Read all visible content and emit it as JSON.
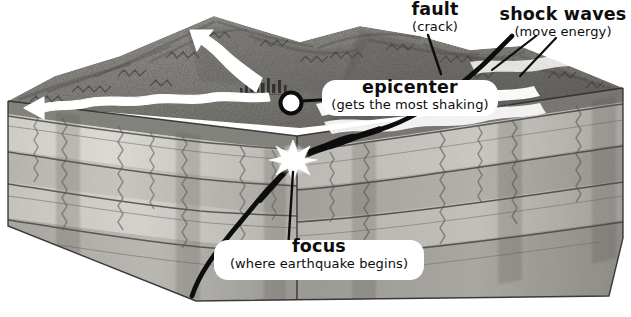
{
  "figure": {
    "background_color": "#ffffff",
    "ink_color": "#0d0d0d",
    "width": 631,
    "height": 317
  },
  "labels": {
    "fault": {
      "term": "fault",
      "note": "(crack)"
    },
    "shock_waves": {
      "term": "shock waves",
      "note": "(move energy)"
    },
    "epicenter": {
      "term": "epicenter",
      "note": "(gets the most shaking)"
    },
    "focus": {
      "term": "focus",
      "note": "(where earthquake begins)"
    }
  },
  "markers": {
    "epicenter_marker": {
      "name": "epicenter-circle",
      "x": 291,
      "y": 103,
      "radius": 9
    },
    "focus_marker": {
      "name": "focus-star",
      "x": 293,
      "y": 160,
      "points": 10
    }
  },
  "block": {
    "description": "Cut-away rectangular block of crust with layered rock strata and a mountainous top surface.",
    "top_surface": "mountain terrain with shaded ridges",
    "strata_layers": [
      {
        "name": "surface soil",
        "shade": "#8e8e8e"
      },
      {
        "name": "upper rock layer",
        "shade": "#d9d7d2"
      },
      {
        "name": "middle rock layer",
        "shade": "#b4b2ad"
      },
      {
        "name": "lower rock layer",
        "shade": "#c9c7c2"
      },
      {
        "name": "deep rock layer",
        "shade": "#a3a19c"
      }
    ]
  },
  "features": {
    "shock_wave_arrows": {
      "name": "white wavy arrows radiating from epicenter across the surface",
      "color": "#ffffff",
      "count": 3
    },
    "fault_line": {
      "name": "thick black crack running from focus up through the surface and down the front face",
      "color": "#0d0d0d"
    },
    "city": {
      "name": "small cluster of buildings near the epicenter"
    },
    "leader_lines": [
      {
        "from": "epicenter-circle",
        "to": "epicenter-label"
      },
      {
        "from": "focus-star",
        "to": "focus-label"
      },
      {
        "from": "fault-label",
        "to": "fault-line"
      },
      {
        "from": "shock-waves-label",
        "to": "shock-wave-arrows"
      }
    ]
  }
}
